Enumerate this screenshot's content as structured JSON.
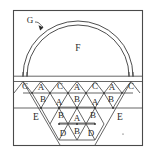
{
  "figure": {
    "kind": "technical-line-diagram",
    "background_color": "#ffffff",
    "line_color": "#3a3a3a",
    "frame": {
      "x": 13,
      "y": 10,
      "width": 130,
      "height": 136
    },
    "deck_line_y": 76
  },
  "labels": {
    "callout": "G",
    "arch_region": "F",
    "side_left": "E",
    "side_right": "E",
    "lattice_rows": [
      {
        "row": 1,
        "cells": [
          "C",
          "A",
          "C",
          "A",
          "C",
          "A",
          "C"
        ]
      },
      {
        "row": 2,
        "cells": [
          "B",
          "A",
          "B",
          "A",
          "B"
        ]
      },
      {
        "row": 3,
        "cells": [
          "B",
          "A",
          "B"
        ]
      },
      {
        "row": 4,
        "cells": [
          "D",
          "B",
          "D"
        ]
      }
    ]
  },
  "geometry": {
    "arc_outer_radius": 55,
    "arc_inner_radius": 51,
    "arc_center_x": 78,
    "arc_center_y": 76,
    "callout_anchor_x": 43,
    "callout_anchor_y": 27
  },
  "colors": {
    "line": "#3a3a3a",
    "frame": "#4a4a4a",
    "heavy_member": "#777777",
    "text": "#2b2b2b",
    "background": "#ffffff"
  }
}
